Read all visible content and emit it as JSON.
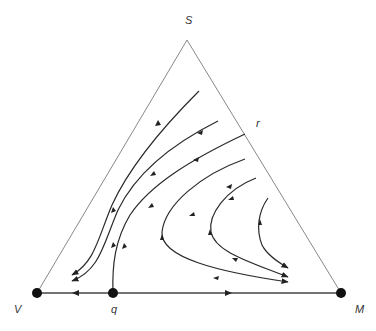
{
  "diagram": {
    "type": "simplex-phase-portrait",
    "vertices": {
      "top": {
        "label": "S",
        "x": 187,
        "y": 40
      },
      "left": {
        "label": "V",
        "x": 37,
        "y": 293
      },
      "right": {
        "label": "M",
        "x": 341,
        "y": 293
      }
    },
    "points": {
      "q": {
        "label": "q",
        "x": 113,
        "y": 293
      },
      "r": {
        "label": "r",
        "x": 245,
        "y": 134
      }
    },
    "colors": {
      "edge": "#888888",
      "trajectory": "#2a2a2a",
      "node": "#111111"
    }
  }
}
